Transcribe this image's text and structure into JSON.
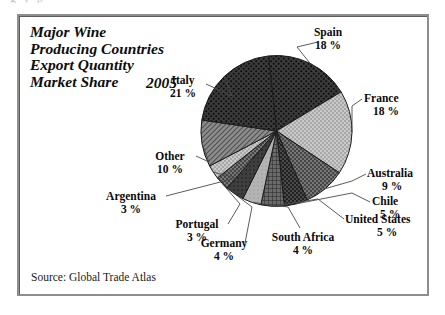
{
  "figure": {
    "top_ghost_text": "g                                      y                                    p",
    "title_lines": "Major Wine\nProducing Countries\nExport Quantity\nMarket Share",
    "year": "2005",
    "source": "Source: Global Trade Atlas"
  },
  "chart_data": {
    "type": "pie",
    "title": "Major Wine Producing Countries Export Quantity Market Share 2005",
    "source": "Source: Global Trade Atlas",
    "unit": "percent market share",
    "legend": "none (direct labels with leader lines)",
    "start_angle_deg": -6,
    "direction": "clockwise",
    "categories": [
      "Spain",
      "France",
      "Australia",
      "Chile",
      "United States",
      "South Africa",
      "Germany",
      "Portugal",
      "Argentina",
      "Other",
      "Italy"
    ],
    "values": [
      18,
      18,
      9,
      5,
      5,
      4,
      4,
      3,
      3,
      10,
      21
    ],
    "labels": [
      {
        "name": "Spain",
        "pct": "18 %",
        "fill": "p-dark-diamond"
      },
      {
        "name": "France",
        "pct": "18 %",
        "fill": "p-light-check"
      },
      {
        "name": "Australia",
        "pct": "9 %",
        "fill": "p-mid-dot"
      },
      {
        "name": "Chile",
        "pct": "5 %",
        "fill": "p-dark-dot"
      },
      {
        "name": "United States",
        "pct": "5 %",
        "fill": "p-mid-grid"
      },
      {
        "name": "South Africa",
        "pct": "4 %",
        "fill": "p-light-plain"
      },
      {
        "name": "Germany",
        "pct": "4 %",
        "fill": "p-dark-plain"
      },
      {
        "name": "Portugal",
        "pct": "3 %",
        "fill": "p-mid-dot"
      },
      {
        "name": "Argentina",
        "pct": "3 %",
        "fill": "p-light-check"
      },
      {
        "name": "Other",
        "pct": "10 %",
        "fill": "p-mid-hatch"
      },
      {
        "name": "Italy",
        "pct": "21 %",
        "fill": "p-dark-diamond"
      }
    ],
    "xlabel": "",
    "ylabel": ""
  },
  "colors": {
    "frame": "#8e8e8e",
    "text": "#0a0a0a",
    "slice_dark": "#3a3a3a",
    "slice_mid": "#6e6e6e",
    "slice_light": "#b9b9b9",
    "leader": "#4a4a4a"
  }
}
